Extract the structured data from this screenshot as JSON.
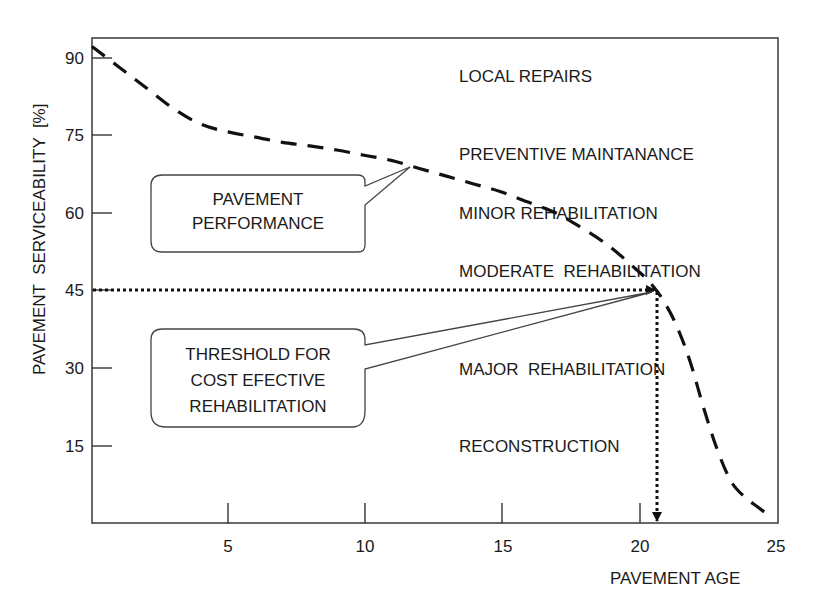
{
  "chart_data": {
    "type": "line",
    "title": "",
    "xlabel": "PAVEMENT AGE",
    "ylabel": "PAVEMENT  SERVICEABILITY  [%]",
    "xlim": [
      0,
      25
    ],
    "ylim": [
      0,
      95
    ],
    "x_ticks": [
      5,
      10,
      15,
      20,
      25
    ],
    "y_ticks": [
      15,
      30,
      45,
      60,
      75,
      90
    ],
    "grid": false,
    "legend": null,
    "series": [
      {
        "name": "PAVEMENT PERFORMANCE",
        "style": "dashed",
        "x": [
          0,
          1,
          2,
          3,
          4,
          5,
          6,
          7,
          8,
          9,
          10,
          11,
          12,
          13,
          14,
          15,
          16,
          17,
          18,
          19,
          20,
          20.5,
          21,
          21.5,
          22,
          22.5,
          23,
          23.5,
          24,
          24.5,
          25
        ],
        "values": [
          92,
          88,
          84,
          80,
          77,
          75.5,
          74.5,
          73.5,
          72.8,
          72,
          71,
          70,
          68.5,
          67,
          65.5,
          64,
          62,
          60,
          57,
          53.5,
          49,
          46.5,
          43,
          38,
          31,
          22,
          14,
          8,
          5,
          3,
          1
        ]
      }
    ],
    "threshold": {
      "x": 20.7,
      "y": 45,
      "style": "dotted-arrows",
      "label": "THRESHOLD FOR COST EFECTIVE REHABILITATION"
    },
    "annotations": [
      {
        "text": "LOCAL REPAIRS",
        "x": 14,
        "y": 84
      },
      {
        "text": "PREVENTIVE MAINTANANCE",
        "x": 14,
        "y": 70
      },
      {
        "text": "MINOR REHABILITATION",
        "x": 14,
        "y": 59.5
      },
      {
        "text": "MODERATE  REHABILITATION",
        "x": 14,
        "y": 48
      },
      {
        "text": "MAJOR  REHABILITATION",
        "x": 14,
        "y": 29.5
      },
      {
        "text": "RECONSTRUCTION",
        "x": 14,
        "y": 15.5
      }
    ]
  },
  "labels": {
    "y_axis_title": "PAVEMENT  SERVICEABILITY  [%]",
    "x_axis_title": "PAVEMENT AGE",
    "x_ticks": [
      "5",
      "10",
      "15",
      "20",
      "25"
    ],
    "y_ticks": [
      "15",
      "30",
      "45",
      "60",
      "75",
      "90"
    ],
    "zones": [
      "LOCAL REPAIRS",
      "PREVENTIVE MAINTANANCE",
      "MINOR REHABILITATION",
      "MODERATE  REHABILITATION",
      "MAJOR  REHABILITATION",
      "RECONSTRUCTION"
    ],
    "callout_performance": [
      "PAVEMENT",
      "PERFORMANCE"
    ],
    "callout_threshold": [
      "THRESHOLD FOR",
      "COST EFECTIVE",
      "REHABILITATION"
    ]
  }
}
